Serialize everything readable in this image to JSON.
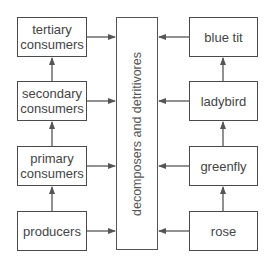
{
  "diagram": {
    "type": "food chain / energy flow diagram",
    "left_column": [
      {
        "label": "tertiary consumers"
      },
      {
        "label": "secondary consumers"
      },
      {
        "label": "primary consumers"
      },
      {
        "label": "producers"
      }
    ],
    "right_column": [
      {
        "label": "blue tit"
      },
      {
        "label": "ladybird"
      },
      {
        "label": "greenfly"
      },
      {
        "label": "rose"
      }
    ],
    "center": {
      "label": "decomposers and detritivores"
    },
    "colors": {
      "line": "#4a4a4a",
      "text": "#444444",
      "background": "#ffffff"
    }
  }
}
